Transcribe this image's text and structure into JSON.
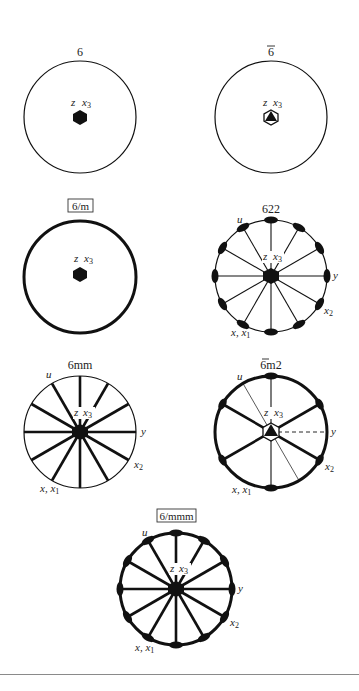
{
  "figure": {
    "diagrams": [
      {
        "id": "6",
        "title": "6",
        "boxed": false,
        "cx": 80,
        "cy": 117,
        "r": 56,
        "stroke": 1.2,
        "center_symbol": "filled-hexagon",
        "labels": {
          "z": "z",
          "x3": "x",
          "x3_sub": "3"
        }
      },
      {
        "id": "6bar",
        "title": "6",
        "overline": true,
        "boxed": false,
        "cx": 271,
        "cy": 117,
        "r": 56,
        "stroke": 1.2,
        "center_symbol": "hexagon-with-triangle",
        "labels": {
          "z": "z",
          "x3": "x",
          "x3_sub": "3"
        }
      },
      {
        "id": "6/m",
        "title": "6/m",
        "boxed": true,
        "cx": 80,
        "cy": 277,
        "r": 56,
        "stroke": 3,
        "center_symbol": "filled-hexagon",
        "labels": {
          "z": "z",
          "x3": "x",
          "x3_sub": "3"
        }
      },
      {
        "id": "622",
        "title": "622",
        "boxed": false,
        "cx": 271,
        "cy": 276,
        "r": 56,
        "stroke": 1.2,
        "center_symbol": "filled-hexagon",
        "labels": {
          "z": "z",
          "x3": "x",
          "x3_sub": "3",
          "u": "u",
          "y": "y",
          "x2": "x",
          "x2_sub": "2",
          "x1": "x, x",
          "x1_sub": "1"
        }
      },
      {
        "id": "6mm",
        "title": "6mm",
        "boxed": false,
        "cx": 80,
        "cy": 432,
        "r": 56,
        "stroke": 1.2,
        "center_symbol": "filled-hexagon",
        "labels": {
          "z": "z",
          "x3": "x",
          "x3_sub": "3",
          "u": "u",
          "y": "y",
          "x2": "x",
          "x2_sub": "2",
          "x1": "x, x",
          "x1_sub": "1"
        }
      },
      {
        "id": "6barm2",
        "title": "6m2",
        "overline_first": true,
        "boxed": false,
        "cx": 271,
        "cy": 432,
        "r": 56,
        "stroke": 3,
        "center_symbol": "hexagon-with-triangle",
        "labels": {
          "z": "z",
          "x3": "x",
          "x3_sub": "3",
          "u": "u",
          "y": "y",
          "x2": "x",
          "x2_sub": "2",
          "x1": "x, x",
          "x1_sub": "1"
        }
      },
      {
        "id": "6/mmm",
        "title": "6/mmm",
        "boxed": true,
        "cx": 176,
        "cy": 589,
        "r": 56,
        "stroke": 3,
        "center_symbol": "filled-hexagon",
        "labels": {
          "z": "z",
          "x3": "x",
          "x3_sub": "3",
          "u": "u",
          "y": "y",
          "x2": "x",
          "x2_sub": "2",
          "x1": "x, x",
          "x1_sub": "1"
        }
      }
    ]
  },
  "colors": {
    "ink": "#111111",
    "text": "#222222",
    "rule": "#8a8a8a",
    "background": "#ffffff"
  }
}
